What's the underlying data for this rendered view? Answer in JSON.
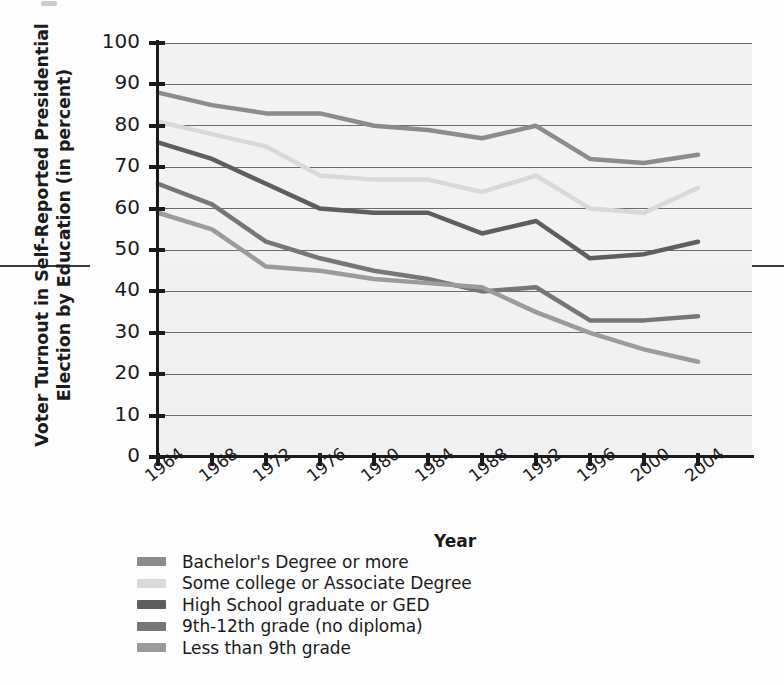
{
  "chart_data": {
    "type": "line",
    "title": "",
    "xlabel": "Year",
    "ylabel": "Voter Turnout in Self-Reported Presidential Election by Education (in percent)",
    "ylabel_line1": "Voter Turnout in Self-Reported Presidential",
    "ylabel_line2": "Election by Education (in percent)",
    "categories": [
      "1964",
      "1968",
      "1972",
      "1976",
      "1980",
      "1984",
      "1988",
      "1992",
      "1996",
      "2000",
      "2004"
    ],
    "x": [
      1964,
      1968,
      1972,
      1976,
      1980,
      1984,
      1988,
      1992,
      1996,
      2000,
      2004
    ],
    "ylim": [
      0,
      100
    ],
    "yticks": [
      0,
      10,
      20,
      30,
      40,
      50,
      60,
      70,
      80,
      90,
      100
    ],
    "grid": true,
    "legend_position": "below-left",
    "series": [
      {
        "name": "Bachelor's Degree or more",
        "color": "#8c8c8c",
        "values": [
          88,
          85,
          83,
          83,
          80,
          79,
          77,
          80,
          72,
          71,
          73
        ]
      },
      {
        "name": "Some college or Associate Degree",
        "color": "#d9d9d9",
        "values": [
          81,
          78,
          75,
          68,
          67,
          67,
          64,
          68,
          60,
          59,
          65
        ]
      },
      {
        "name": "High School graduate or GED",
        "color": "#5e5e5e",
        "values": [
          76,
          72,
          66,
          60,
          59,
          59,
          54,
          57,
          48,
          49,
          52
        ]
      },
      {
        "name": "9th-12th grade (no diploma)",
        "color": "#767676",
        "values": [
          66,
          61,
          52,
          48,
          45,
          43,
          40,
          41,
          33,
          33,
          34
        ]
      },
      {
        "name": "Less than 9th grade",
        "color": "#9b9b9b",
        "values": [
          59,
          55,
          46,
          45,
          43,
          42,
          41,
          35,
          30,
          26,
          23
        ]
      }
    ]
  },
  "axes": {
    "y_tick_labels": [
      "100",
      "90",
      "80",
      "70",
      "60",
      "50",
      "40",
      "30",
      "20",
      "10",
      "0"
    ],
    "x_tick_labels": [
      "1964",
      "1968",
      "1972",
      "1976",
      "1980",
      "1984",
      "1988",
      "1992",
      "1996",
      "2000",
      "2004"
    ],
    "x_axis_title": "Year"
  },
  "legend": {
    "items": [
      {
        "label": "Bachelor's Degree or more",
        "color": "#8c8c8c"
      },
      {
        "label": "Some college or Associate Degree",
        "color": "#d9d9d9"
      },
      {
        "label": "High School graduate or GED",
        "color": "#5e5e5e"
      },
      {
        "label": "9th-12th grade (no diploma)",
        "color": "#767676"
      },
      {
        "label": "Less than 9th grade",
        "color": "#9b9b9b"
      }
    ]
  },
  "colors": {
    "axis": "#1b1b1b",
    "gridline": "#6b6b6b",
    "plot_background": "#f2f2f2",
    "page_background": "#fdfdfd"
  }
}
